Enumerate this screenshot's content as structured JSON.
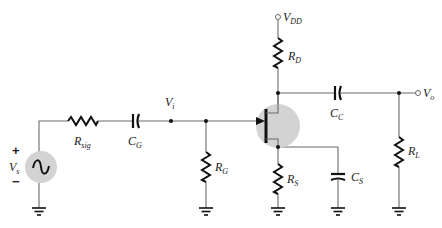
{
  "diagram": {
    "type": "JFET common-source amplifier schematic",
    "colors": {
      "wire": "#6b6b6b",
      "component": "#111111",
      "highlight": "#d3d3d3",
      "background": "#ffffff"
    },
    "source": {
      "label_main": "V",
      "label_sub": "s",
      "plus": "+",
      "minus": "−"
    },
    "resistors": {
      "rsig": {
        "main": "R",
        "sub": "sig"
      },
      "rg": {
        "main": "R",
        "sub": "G"
      },
      "rd": {
        "main": "R",
        "sub": "D"
      },
      "rs": {
        "main": "R",
        "sub": "S"
      },
      "rl": {
        "main": "R",
        "sub": "L"
      }
    },
    "capacitors": {
      "cg": {
        "main": "C",
        "sub": "G"
      },
      "cc": {
        "main": "C",
        "sub": "C"
      },
      "cs": {
        "main": "C",
        "sub": "S"
      }
    },
    "nodes": {
      "vi": {
        "main": "V",
        "sub": "i"
      },
      "vdd": {
        "main": "V",
        "sub": "DD"
      },
      "vo": {
        "main": "V",
        "sub": "o"
      }
    },
    "transistor": {
      "kind": "n-channel JFET"
    }
  }
}
